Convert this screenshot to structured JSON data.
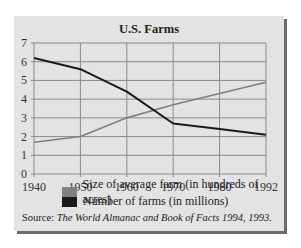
{
  "chart_data": {
    "type": "line",
    "title": "U.S. Farms",
    "xlabel": "",
    "ylabel": "",
    "x": [
      "1940",
      "1950",
      "1960",
      "1970",
      "1980",
      "1992"
    ],
    "yticks": [
      "0",
      "1",
      "2",
      "3",
      "4",
      "5",
      "6",
      "7"
    ],
    "ylim": [
      0,
      7
    ],
    "grid": true,
    "legend_position": "bottom",
    "series": [
      {
        "name": "Size of average farm (in hundreds of acres)",
        "color": "#808080",
        "values": [
          1.7,
          2.0,
          3.0,
          3.7,
          4.3,
          4.9
        ]
      },
      {
        "name": "Number of farms (in millions)",
        "color": "#1a1a1a",
        "values": [
          6.2,
          5.6,
          4.4,
          2.7,
          2.4,
          2.1
        ]
      }
    ]
  },
  "source": {
    "prefix": "Source: ",
    "text": "The World Almanac and Book of Facts 1994, 1993."
  },
  "colors": {
    "panel_bg": "#e3e3e3",
    "shadow": "#6b6b6b",
    "grid": "#8a8a8a"
  }
}
